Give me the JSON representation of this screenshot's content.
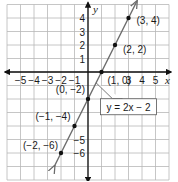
{
  "chart_data": {
    "type": "line",
    "title": "",
    "xlabel": "x",
    "ylabel": "y",
    "xlim": [
      -6,
      6
    ],
    "ylim": [
      -8,
      5
    ],
    "grid": true,
    "x_ticks": [
      -5,
      -4,
      -3,
      -2,
      -1,
      3,
      4,
      5
    ],
    "x_tick_labels": [
      "−5",
      "−4",
      "−3",
      "−2",
      "−1",
      "3",
      "4",
      "5"
    ],
    "y_ticks": [
      1,
      2,
      3,
      4,
      -5,
      -6
    ],
    "y_tick_labels": [
      "1",
      "2",
      "3",
      "4",
      "−5",
      "−6"
    ],
    "series": [
      {
        "name": "y = 2x − 2",
        "slope": 2,
        "intercept": -2,
        "color": "#6b6b6b",
        "x_range": [
          -2.5,
          3.6
        ]
      }
    ],
    "points": [
      {
        "x": 3,
        "y": 4,
        "label": "(3, 4)"
      },
      {
        "x": 2,
        "y": 2,
        "label": "(2, 2)"
      },
      {
        "x": 1,
        "y": 0,
        "label": "(1, 0)"
      },
      {
        "x": 0,
        "y": -2,
        "label": "(0, −2)"
      },
      {
        "x": -1,
        "y": -4,
        "label": "(−1, −4)"
      },
      {
        "x": -2,
        "y": -6,
        "label": "(−2, −6)"
      }
    ],
    "annotation": {
      "text": "y = 2x − 2",
      "points_to": {
        "x": 0.6,
        "y": -0.8
      },
      "box_at": {
        "x": 3,
        "y": -2.5
      }
    },
    "colors": {
      "grid": "#b8b8b8",
      "axis": "#111111",
      "line": "#6b6b6b",
      "point": "#111111"
    }
  }
}
